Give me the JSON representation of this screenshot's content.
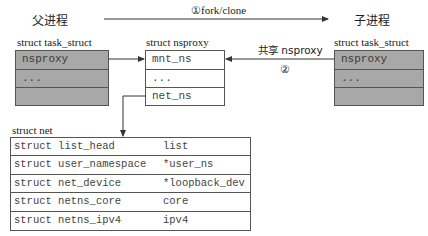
{
  "parent": {
    "title": "父进程",
    "struct_label": "struct task_struct",
    "rows": [
      "nsproxy",
      "...",
      ""
    ]
  },
  "child": {
    "title": "子进程",
    "struct_label": "struct task_struct",
    "rows": [
      "nsproxy",
      "...",
      ""
    ]
  },
  "nsproxy": {
    "struct_label": "struct nsproxy",
    "rows": [
      "mnt_ns",
      "...",
      "net_ns"
    ]
  },
  "arrows": {
    "fork": "①fork/clone",
    "share": "共享 nsproxy",
    "share_step": "②"
  },
  "net": {
    "struct_label": "struct net",
    "rows": [
      {
        "type": "struct list_head",
        "field": "list"
      },
      {
        "type": "struct user_namespace",
        "field": "*user_ns"
      },
      {
        "type": "struct net_device",
        "field": "*loopback_dev"
      },
      {
        "type": "struct netns_core",
        "field": "core"
      },
      {
        "type": "struct netns_ipv4",
        "field": "ipv4"
      }
    ]
  },
  "colors": {
    "task_struct_fill": "#a8a8a8",
    "border": "#555555",
    "line": "#333333"
  }
}
